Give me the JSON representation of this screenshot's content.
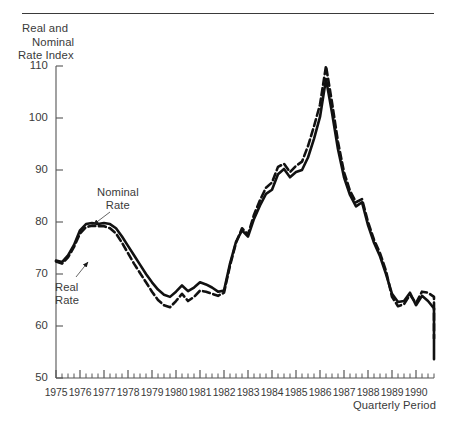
{
  "figure": {
    "y_axis_title_lines": [
      "Real and",
      "Nominal",
      "Rate Index"
    ],
    "x_axis_title": "Quarterly Period"
  },
  "annotations": {
    "nominal": {
      "line1": "Nominal",
      "line2": "Rate"
    },
    "real": {
      "line1": "Real",
      "line2": "Rate"
    }
  },
  "chart_data": {
    "type": "line",
    "title": "",
    "xlabel": "Quarterly Period",
    "ylabel": "Real and Nominal Rate Index",
    "ylim": [
      50,
      110
    ],
    "yticks": [
      50,
      60,
      70,
      80,
      90,
      100,
      110
    ],
    "ytick_labels": [
      "50",
      "60",
      "70",
      "80",
      "90",
      "100",
      "110"
    ],
    "xlim": [
      1975.0,
      1990.75
    ],
    "xtick_labels": [
      "1975",
      "1976",
      "1977",
      "1978",
      "1979",
      "1980",
      "1981",
      "1982",
      "1983",
      "1984",
      "1985",
      "1986",
      "1987",
      "1988",
      "1989",
      "1990"
    ],
    "x_minor_tick_interval_years": 0.25,
    "x_major_tick_interval_years": 1,
    "grid": false,
    "legend_position": "inline-annotations",
    "x": [
      1975.0,
      1975.25,
      1975.5,
      1975.75,
      1976.0,
      1976.25,
      1976.5,
      1976.75,
      1977.0,
      1977.25,
      1977.5,
      1977.75,
      1978.0,
      1978.25,
      1978.5,
      1978.75,
      1979.0,
      1979.25,
      1979.5,
      1979.75,
      1980.0,
      1980.25,
      1980.5,
      1980.75,
      1981.0,
      1981.25,
      1981.5,
      1981.75,
      1982.0,
      1982.25,
      1982.5,
      1982.75,
      1983.0,
      1983.25,
      1983.5,
      1983.75,
      1984.0,
      1984.25,
      1984.5,
      1984.75,
      1985.0,
      1985.25,
      1985.5,
      1985.75,
      1986.0,
      1986.25,
      1986.5,
      1986.75,
      1987.0,
      1987.25,
      1987.5,
      1987.75,
      1988.0,
      1988.25,
      1988.5,
      1988.75,
      1989.0,
      1989.25,
      1989.5,
      1989.75,
      1990.0,
      1990.25,
      1990.5,
      1990.75
    ],
    "series": [
      {
        "name": "Nominal Rate",
        "style": "solid",
        "color": "#111111",
        "values": [
          72.6,
          72.3,
          73.6,
          75.6,
          78.4,
          79.6,
          79.8,
          79.6,
          79.8,
          79.6,
          78.8,
          77.2,
          75.4,
          73.6,
          71.8,
          70.0,
          68.4,
          67.0,
          66.0,
          65.6,
          66.6,
          67.8,
          66.7,
          67.4,
          68.4,
          68.0,
          67.4,
          66.6,
          66.8,
          72.0,
          76.2,
          78.4,
          77.2,
          80.6,
          83.2,
          85.4,
          86.2,
          89.2,
          90.2,
          88.6,
          89.6,
          90.0,
          92.4,
          96.0,
          100.2,
          107.5,
          101.0,
          94.0,
          88.6,
          85.2,
          83.0,
          83.8,
          79.4,
          76.0,
          73.4,
          70.0,
          66.2,
          64.6,
          64.8,
          66.4,
          64.0,
          65.8,
          64.8,
          63.4
        ]
      },
      {
        "name": "Real Rate",
        "style": "dashed",
        "color": "#111111",
        "values": [
          72.4,
          72.0,
          73.2,
          75.2,
          77.8,
          79.0,
          79.3,
          79.2,
          79.2,
          78.8,
          77.8,
          76.0,
          74.0,
          72.0,
          70.2,
          68.4,
          66.6,
          65.0,
          64.0,
          63.6,
          64.8,
          66.2,
          64.8,
          65.6,
          66.8,
          66.6,
          66.2,
          65.8,
          66.4,
          71.6,
          76.0,
          78.8,
          77.6,
          81.4,
          84.2,
          86.6,
          87.6,
          90.6,
          91.2,
          89.6,
          90.8,
          91.6,
          94.6,
          98.4,
          102.6,
          110.0,
          103.0,
          95.4,
          89.6,
          86.0,
          83.8,
          84.4,
          80.0,
          76.6,
          74.0,
          70.6,
          65.6,
          63.8,
          64.2,
          66.0,
          64.4,
          66.6,
          66.4,
          65.6
        ]
      }
    ],
    "series_endpoints_note": {
      "nominal_end": 53.6,
      "real_end": 57.6
    }
  },
  "plot_geometry": {
    "left_px": 56,
    "right_px": 434,
    "top_px": 66,
    "bottom_px": 378
  }
}
